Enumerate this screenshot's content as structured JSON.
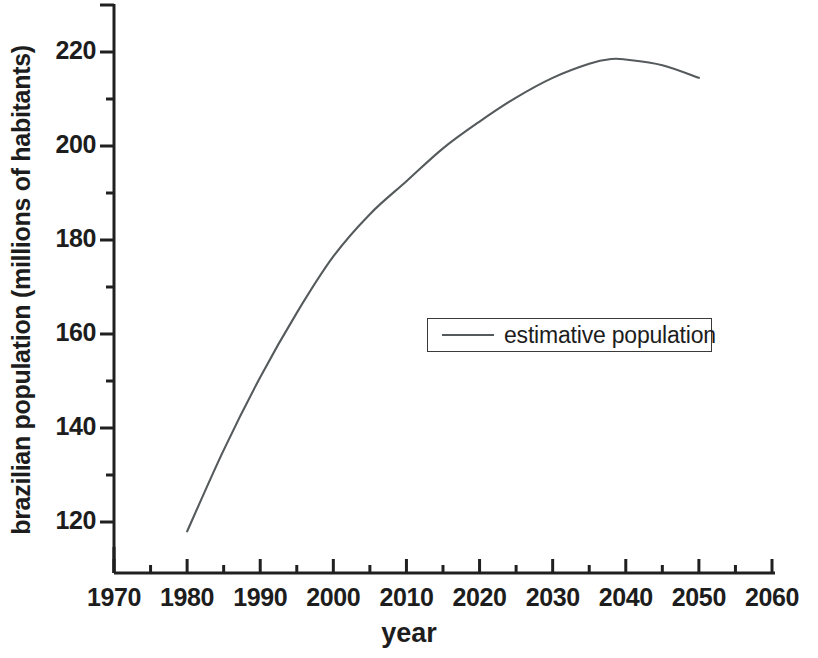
{
  "chart_data": {
    "type": "line",
    "title": "",
    "xlabel": "year",
    "ylabel": "brazilian population (millions of habitants)",
    "xlim": [
      1970,
      2060
    ],
    "ylim": [
      112,
      226
    ],
    "grid": false,
    "legend_position": "center-right",
    "x_ticks": [
      "1970",
      "1980",
      "1990",
      "2000",
      "2010",
      "2020",
      "2030",
      "2040",
      "2050",
      "2060"
    ],
    "x_tick_values": [
      1970,
      1980,
      1990,
      2000,
      2010,
      2020,
      2030,
      2040,
      2050,
      2060
    ],
    "x_minor_tick_values": [
      1975,
      1985,
      1995,
      2005,
      2015,
      2025,
      2035,
      2045,
      2055
    ],
    "y_ticks": [
      "120",
      "140",
      "160",
      "180",
      "200",
      "220"
    ],
    "y_tick_values": [
      120,
      140,
      160,
      180,
      200,
      220
    ],
    "y_minor_tick_values": [
      130,
      150,
      170,
      190,
      210
    ],
    "series": [
      {
        "name": "estimative population",
        "color": "#555a5c",
        "x": [
          1980,
          1985,
          1990,
          1995,
          2000,
          2005,
          2010,
          2015,
          2020,
          2025,
          2030,
          2035,
          2038,
          2040,
          2045,
          2050
        ],
        "values": [
          118.0,
          135.3,
          150.8,
          164.5,
          176.5,
          185.5,
          192.5,
          199.5,
          205.2,
          210.3,
          214.5,
          217.5,
          218.5,
          218.4,
          217.2,
          214.5
        ]
      }
    ]
  },
  "legend": {
    "entries": [
      {
        "label": "estimative population",
        "swatch": "line-swatch"
      }
    ]
  },
  "axes": {
    "x_title": "year",
    "y_title": "brazilian population (millions of habitants)"
  },
  "colors": {
    "line": "#555a5c",
    "axis": "#202020",
    "text": "#1d1d1d",
    "background": "#ffffff"
  }
}
